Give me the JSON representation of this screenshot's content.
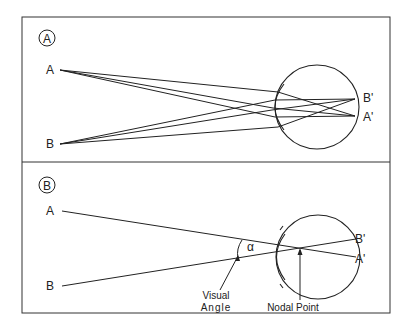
{
  "panel_a": {
    "badge": "A",
    "object_top": "A",
    "object_bottom": "B",
    "image_top": "B'",
    "image_bottom": "A'"
  },
  "panel_b": {
    "badge": "B",
    "object_top": "A",
    "object_bottom": "B",
    "image_top": "B'",
    "image_bottom": "A'",
    "angle_symbol": "α",
    "visual_angle_line1": "Visual",
    "visual_angle_line2": "Angle",
    "nodal_point": "Nodal Point"
  },
  "colors": {
    "line": "#222222",
    "background": "#ffffff",
    "frame": "#333333"
  }
}
